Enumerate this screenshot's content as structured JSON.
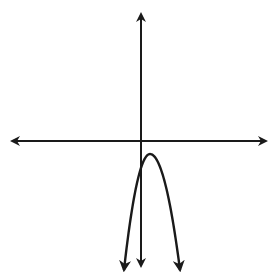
{
  "figure": {
    "background": "#ffffff",
    "stroke_color": "#1a1a1a",
    "axes": {
      "x_axis": {
        "y": 141,
        "x_start": 8,
        "x_end": 269,
        "arrows": "both"
      },
      "y_axis": {
        "x": 141,
        "y_start": 10,
        "y_end": 271,
        "arrows": "both"
      }
    },
    "parabola": {
      "opens": "down",
      "vertex": {
        "x": 150,
        "y": 154
      },
      "left_end": {
        "x": 124,
        "y": 270
      },
      "right_end": {
        "x": 180,
        "y": 270
      },
      "end_arrows": true
    },
    "labels": []
  }
}
